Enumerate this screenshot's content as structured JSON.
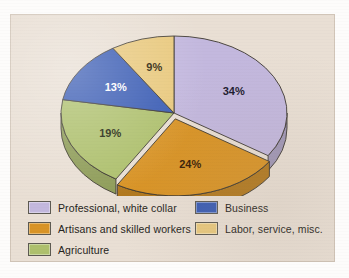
{
  "panel": {
    "background_color": "#e9dfd4"
  },
  "chart_data": {
    "type": "pie",
    "title": "",
    "subtitle": "",
    "xlabel": "",
    "ylabel": "",
    "grid": false,
    "legend_position": "bottom",
    "unit": "%",
    "start_angle_deg": 0,
    "direction": "clockwise",
    "three_d": true,
    "exploded_slice": "Artisans and skilled workers",
    "categories": [
      "Professional, white collar",
      "Artisans and skilled workers",
      "Agriculture",
      "Business",
      "Labor, service, misc."
    ],
    "values": [
      34,
      24,
      19,
      13,
      9
    ],
    "value_labels": [
      "34%",
      "24%",
      "19%",
      "13%",
      "9%"
    ],
    "colors": [
      "#c3b8de",
      "#d99426",
      "#aec06d",
      "#3a5cb4",
      "#e9c97e"
    ],
    "label_text_colors": [
      "#1c1a2e",
      "#3a1d05",
      "#22260e",
      "#ffffff",
      "#2a2208"
    ],
    "slices": [
      {
        "label": "Professional, white collar",
        "value": 34,
        "display": "34%",
        "color": "#c3b8de",
        "label_color": "#1c1a2e"
      },
      {
        "label": "Artisans and skilled workers",
        "value": 24,
        "display": "24%",
        "color": "#d99426",
        "label_color": "#3a1d05"
      },
      {
        "label": "Agriculture",
        "value": 19,
        "display": "19%",
        "color": "#aec06d",
        "label_color": "#22260e"
      },
      {
        "label": "Business",
        "value": 13,
        "display": "13%",
        "color": "#3a5cb4",
        "label_color": "#ffffff"
      },
      {
        "label": "Labor, service, misc.",
        "value": 9,
        "display": "9%",
        "color": "#e9c97e",
        "label_color": "#2a2208"
      }
    ]
  },
  "legend": {
    "left_column": [
      {
        "label": "Professional, white collar",
        "color": "#c3b8de"
      },
      {
        "label": "Artisans and skilled workers",
        "color": "#d99426"
      },
      {
        "label": "Agriculture",
        "color": "#aec06d"
      }
    ],
    "right_column": [
      {
        "label": "Business",
        "color": "#3a5cb4"
      },
      {
        "label": "Labor, service, misc.",
        "color": "#e9c97e"
      }
    ]
  }
}
